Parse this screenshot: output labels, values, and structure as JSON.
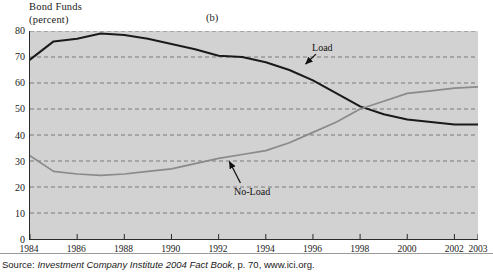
{
  "header": {
    "title_line1": "Bond Funds",
    "title_line2": "(percent)",
    "panel_letter": "(b)"
  },
  "source": {
    "prefix": "Source: ",
    "italic": "Investment Company Institute 2004 Fact Book",
    "suffix": ", p. 70, www.ici.org."
  },
  "colors": {
    "plot_background": "#d2d2d2",
    "axis": "#2a2a2a",
    "gridline": "#6f6f6f",
    "load_line": "#1a1a1a",
    "noload_line": "#8a8a8a",
    "page_background": "#ffffff"
  },
  "chart_data": {
    "type": "line",
    "title": "Bond Funds (percent)",
    "subtitle": "(b)",
    "xlabel": "",
    "ylabel": "percent",
    "xlim": [
      1984,
      2003
    ],
    "ylim": [
      0,
      80
    ],
    "grid": true,
    "grid_axis": "y",
    "legend_position": "inline-annotations",
    "yticks": [
      0,
      10,
      20,
      30,
      40,
      50,
      60,
      70,
      80
    ],
    "ytick_labels": [
      "0",
      "10",
      "20",
      "30",
      "40",
      "50",
      "60",
      "70",
      "80"
    ],
    "xticks": [
      1984,
      1986,
      1988,
      1990,
      1992,
      1994,
      1996,
      1998,
      2000,
      2002,
      2003
    ],
    "xtick_labels": [
      "1984",
      "1986",
      "1988",
      "1990",
      "1992",
      "1994",
      "1996",
      "1998",
      "2000",
      "2002",
      "2003"
    ],
    "x": [
      1984,
      1985,
      1986,
      1987,
      1988,
      1989,
      1990,
      1991,
      1992,
      1993,
      1994,
      1995,
      1996,
      1997,
      1998,
      1999,
      2000,
      2001,
      2002,
      2003
    ],
    "series": [
      {
        "name": "Load",
        "label": "Load",
        "color": "#1a1a1a",
        "values": [
          69,
          76,
          77,
          79,
          78.5,
          77,
          75,
          73,
          70.5,
          70,
          68,
          65,
          61,
          56,
          51,
          48,
          46,
          45,
          44,
          44
        ]
      },
      {
        "name": "No-Load",
        "label": "No-Load",
        "color": "#8a8a8a",
        "values": [
          32,
          26,
          25,
          24.5,
          25,
          26,
          27,
          29,
          31,
          32.5,
          34,
          37,
          41,
          45,
          50,
          53,
          56,
          57,
          58,
          58.5
        ]
      }
    ],
    "annotations": [
      {
        "text": "Load",
        "x": 1996.4,
        "y": 73.5,
        "arrow_to_x": 1995.6,
        "arrow_to_y": 66.5
      },
      {
        "text": "No-Load",
        "x": 1993.1,
        "y": 18.5,
        "arrow_to_x": 1992.4,
        "arrow_to_y": 30.8
      }
    ]
  }
}
